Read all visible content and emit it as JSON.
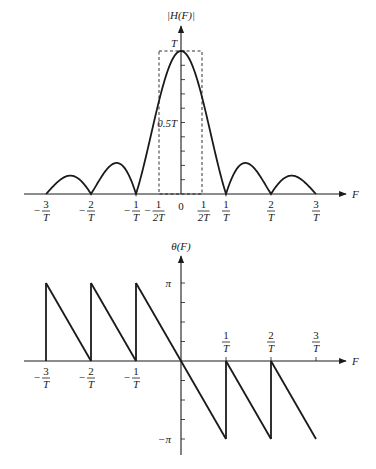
{
  "chart_data": [
    {
      "type": "line",
      "title": "Magnitude response",
      "ylabel": "|H(F)|",
      "xlabel": "F",
      "function": "|T*sin(pi*F*T)/(pi*F*T)|",
      "xlim_over_T": [
        -3.6,
        3.6
      ],
      "ylim": [
        "0",
        "T"
      ],
      "x_ticks": [
        {
          "value": -3,
          "neg": true,
          "num": "3",
          "den": "T"
        },
        {
          "value": -2,
          "neg": true,
          "num": "2",
          "den": "T"
        },
        {
          "value": -1,
          "neg": true,
          "num": "1",
          "den": "T"
        },
        {
          "value": -0.5,
          "neg": true,
          "num": "1",
          "den": "2T"
        },
        {
          "value": 0,
          "plain": "0"
        },
        {
          "value": 0.5,
          "neg": false,
          "num": "1",
          "den": "2T"
        },
        {
          "value": 1,
          "neg": false,
          "num": "1",
          "den": "T"
        },
        {
          "value": 2,
          "neg": false,
          "num": "2",
          "den": "T"
        },
        {
          "value": 3,
          "neg": false,
          "num": "3",
          "den": "T"
        }
      ],
      "y_labels": [
        {
          "value": 1.0,
          "text": "T"
        },
        {
          "value": 0.5,
          "text": "0.5T"
        }
      ],
      "y_minor_ticks": 10,
      "annotation": "dashed rectangle spanning F = -1/2T to 1/2T, height T"
    },
    {
      "type": "line",
      "title": "Phase response",
      "ylabel": "θ(F)",
      "xlabel": "F",
      "xlim_over_T": [
        -3.6,
        3.6
      ],
      "ylim": [
        "-π",
        "π"
      ],
      "description": "Linear phase -πFT wrapped; jumps at F = ±1/T, ±2/T; starts at +π at F=-3/T and ends at -π at F=3/T",
      "x_ticks_below": [
        {
          "value": -3,
          "neg": true,
          "num": "3",
          "den": "T"
        },
        {
          "value": -2,
          "neg": true,
          "num": "2",
          "den": "T"
        },
        {
          "value": -1,
          "neg": true,
          "num": "1",
          "den": "T"
        }
      ],
      "x_ticks_above": [
        {
          "value": 1,
          "neg": false,
          "num": "1",
          "den": "T"
        },
        {
          "value": 2,
          "neg": false,
          "num": "2",
          "den": "T"
        },
        {
          "value": 3,
          "neg": false,
          "num": "3",
          "den": "T"
        }
      ],
      "y_labels": [
        {
          "value": 1,
          "text": "π"
        },
        {
          "value": -1,
          "text": "−π"
        }
      ],
      "y_minor_ticks_per_half": 4,
      "segments": [
        {
          "from": [
            -3,
            1
          ],
          "to": [
            -2,
            0
          ]
        },
        {
          "from": [
            -2,
            1
          ],
          "to": [
            -1,
            0
          ]
        },
        {
          "from": [
            -1,
            1
          ],
          "to": [
            1,
            -1
          ]
        },
        {
          "from": [
            1,
            0
          ],
          "to": [
            2,
            -1
          ]
        },
        {
          "from": [
            2,
            0
          ],
          "to": [
            3,
            -1
          ]
        }
      ],
      "jumps": [
        {
          "x": -3,
          "from": 0,
          "to": 1
        },
        {
          "x": -2,
          "from": 0,
          "to": 1
        },
        {
          "x": -1,
          "from": 0,
          "to": 1
        },
        {
          "x": 1,
          "from": 0,
          "to": -1
        },
        {
          "x": 2,
          "from": 0,
          "to": -1
        }
      ]
    }
  ],
  "labels": {
    "top_ylabel": "|H(F)|",
    "bottom_ylabel": "θ(F)",
    "xlabel": "F"
  }
}
